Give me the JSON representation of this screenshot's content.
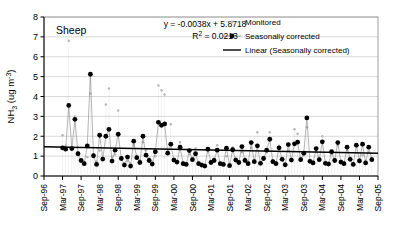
{
  "chart_data": {
    "type": "line",
    "title": "",
    "panel_label": "Sheep",
    "xlabel": "",
    "ylabel": "NH3 (ug m-3)",
    "ylabel_parts": {
      "base": "NH",
      "sub": "3",
      "unit_open": " (ug m",
      "sup": "-3",
      "unit_close": ")"
    },
    "ylim": [
      0,
      8
    ],
    "yticks": [
      0,
      1,
      2,
      3,
      4,
      5,
      6,
      7,
      8
    ],
    "grid": "horizontal",
    "legend_position": "top-right",
    "xtick_labels": [
      "Sep-96",
      "Mar-97",
      "Sep-97",
      "Mar-98",
      "Sep-98",
      "Mar-99",
      "Sep-99",
      "Mar-00",
      "Sep-00",
      "Mar-01",
      "Sep-01",
      "Mar-02",
      "Sep-02",
      "Mar-03",
      "Sep-03",
      "Mar-04",
      "Sep-04",
      "Mar-05",
      "Sep-05"
    ],
    "x_start_label": "Sep-96",
    "x_end_label": "Sep-05",
    "annotations": {
      "equation": "y = -0.0038x + 5.8718",
      "r_squared_base": "R",
      "r_squared_sup": "2",
      "r_squared_value": " = 0.0213"
    },
    "trendline": {
      "name": "Linear (Seasonally corrected)",
      "slope_per_month": -0.0029,
      "y_at_start": 1.47,
      "y_at_end": 1.14,
      "color": "#000000"
    },
    "series": [
      {
        "name": "Monitored",
        "marker": "small-dot",
        "color": "#b8b8b8",
        "values": [
          null,
          null,
          null,
          null,
          null,
          null,
          2.05,
          1.52,
          6.8,
          1.35,
          3.0,
          1.18,
          0.82,
          0.7,
          0.95,
          4.15,
          1.1,
          0.72,
          1.28,
          0.88,
          3.6,
          4.4,
          0.98,
          1.08,
          3.3,
          0.92,
          0.66,
          0.74,
          0.62,
          1.55,
          1.02,
          0.8,
          1.7,
          1.3,
          0.9,
          0.7,
          1.0,
          4.55,
          4.32,
          4.1,
          1.25,
          2.6,
          0.88,
          0.76,
          1.7,
          0.7,
          0.66,
          1.1,
          0.92,
          1.4,
          0.7,
          0.62,
          0.58,
          1.25,
          0.74,
          0.88,
          1.55,
          0.7,
          0.66,
          1.0,
          0.6,
          1.45,
          0.9,
          0.76,
          1.2,
          0.88,
          0.7,
          1.42,
          0.8,
          2.2,
          0.72,
          0.96,
          1.18,
          2.2,
          0.8,
          0.7,
          1.52,
          0.92,
          0.64,
          1.28,
          0.88,
          2.35,
          2.12,
          0.9,
          1.05,
          2.45,
          0.82,
          0.74,
          1.25,
          0.9,
          2.0,
          0.72,
          0.68,
          1.1,
          0.86,
          1.55,
          0.78,
          0.7,
          1.3,
          0.92,
          0.66,
          1.48,
          0.84,
          1.05,
          0.74,
          1.18,
          0.9
        ]
      },
      {
        "name": "Seasonally corrected",
        "marker": "filled-circle",
        "color": "#000000",
        "connected": true,
        "values": [
          null,
          null,
          null,
          null,
          null,
          null,
          1.42,
          1.35,
          3.55,
          1.38,
          2.85,
          1.12,
          0.78,
          0.62,
          1.52,
          5.12,
          1.02,
          0.58,
          2.05,
          0.85,
          2.0,
          2.35,
          0.75,
          1.3,
          2.1,
          0.88,
          0.55,
          0.95,
          0.5,
          1.75,
          0.92,
          0.68,
          2.0,
          1.05,
          0.78,
          0.6,
          1.22,
          2.7,
          2.55,
          2.62,
          1.15,
          1.6,
          0.8,
          0.7,
          1.45,
          0.62,
          0.58,
          1.28,
          0.82,
          1.12,
          0.62,
          0.55,
          0.5,
          1.35,
          0.68,
          0.78,
          1.3,
          0.62,
          0.58,
          1.4,
          0.52,
          1.32,
          0.8,
          0.68,
          1.48,
          0.78,
          0.62,
          1.68,
          0.72,
          1.52,
          0.64,
          0.88,
          1.3,
          1.85,
          0.72,
          0.62,
          1.42,
          0.84,
          0.56,
          1.58,
          0.8,
          1.62,
          1.7,
          0.82,
          1.15,
          2.92,
          0.74,
          0.66,
          1.38,
          0.82,
          1.72,
          0.64,
          0.6,
          1.22,
          0.78,
          1.68,
          0.7,
          0.62,
          1.45,
          0.84,
          0.58,
          1.55,
          0.76,
          1.6,
          0.66,
          1.45,
          0.82
        ]
      }
    ]
  },
  "legend": {
    "items": [
      {
        "label": "Monitored",
        "type": "marker",
        "color": "#b8b8b8"
      },
      {
        "label": "Seasonally corrected",
        "type": "marker",
        "color": "#000000"
      },
      {
        "label": "Linear (Seasonally corrected)",
        "type": "line",
        "color": "#000000"
      }
    ]
  }
}
